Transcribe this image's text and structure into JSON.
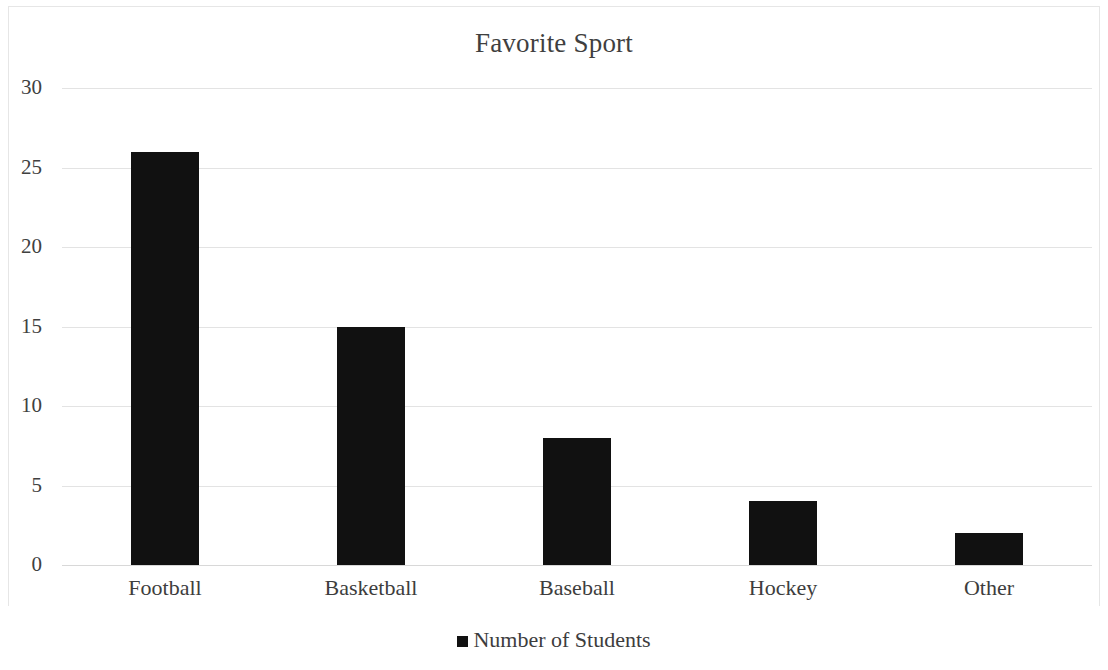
{
  "chart_data": {
    "type": "bar",
    "title": "Favorite Sport",
    "xlabel": "",
    "ylabel": "",
    "categories": [
      "Football",
      "Basketball",
      "Baseball",
      "Hockey",
      "Other"
    ],
    "values": [
      26,
      15,
      8,
      4,
      2
    ],
    "series": [
      {
        "name": "Number of Students",
        "values": [
          26,
          15,
          8,
          4,
          2
        ]
      }
    ],
    "ylim": [
      0,
      30
    ],
    "y_ticks": [
      0,
      5,
      10,
      15,
      20,
      25,
      30
    ],
    "y_tick_labels": [
      "0",
      "5",
      "10",
      "15",
      "20",
      "25",
      "30"
    ],
    "grid": true,
    "grid_axis": "y",
    "legend": {
      "position": "bottom",
      "entries": [
        {
          "label": "Number of Students",
          "color": "#111111"
        }
      ]
    },
    "bar_color": "#111111",
    "background_color": "#ffffff",
    "gridline_color": "#e3e3e3"
  }
}
